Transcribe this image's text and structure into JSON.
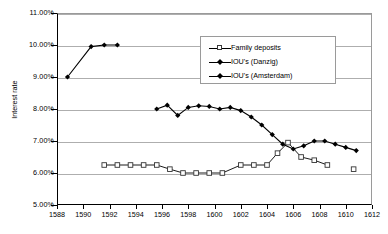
{
  "chart_data": {
    "type": "line",
    "title": "",
    "xlabel": "",
    "ylabel": "Interest rate",
    "xlim": [
      1588,
      1612
    ],
    "ylim": [
      5.0,
      11.0
    ],
    "grid": true,
    "legend_position": "upper-right-inside",
    "y_ticks": [
      "5.00%",
      "6.00%",
      "7.00%",
      "8.00%",
      "9.00%",
      "10.00%",
      "11.00%"
    ],
    "y_tick_values": [
      5.0,
      6.0,
      7.0,
      8.0,
      9.0,
      10.0,
      11.0
    ],
    "x_ticks": [
      "1588",
      "1590",
      "1592",
      "1594",
      "1596",
      "1598",
      "1600",
      "1602",
      "1604",
      "1606",
      "1608",
      "1610",
      "1612"
    ],
    "x_tick_values": [
      1588,
      1590,
      1592,
      1594,
      1596,
      1598,
      1600,
      1602,
      1604,
      1606,
      1608,
      1610,
      1612
    ],
    "series": [
      {
        "name": "Family deposits",
        "marker": "open-square",
        "color": "#000000",
        "x": [
          1591.6,
          1592.6,
          1593.6,
          1594.6,
          1595.6,
          1596.6,
          1597.6,
          1598.6,
          1599.6,
          1600.6,
          1602.0,
          1603.0,
          1604.0,
          1604.8,
          1605.6,
          1606.6,
          1607.6,
          1608.6,
          1610.6
        ],
        "y": [
          6.25,
          6.25,
          6.25,
          6.25,
          6.25,
          6.12,
          6.0,
          6.0,
          6.0,
          6.0,
          6.25,
          6.25,
          6.25,
          6.62,
          6.95,
          6.5,
          6.4,
          6.25,
          6.12
        ]
      },
      {
        "name": "IOU's (Danzig)",
        "marker": "filled-diamond",
        "color": "#000000",
        "x": [
          1588.8,
          1590.6,
          1591.6,
          1592.6
        ],
        "y": [
          9.0,
          9.95,
          10.0,
          10.0
        ]
      },
      {
        "name": "IOU's (Amsterdam)",
        "marker": "filled-diamond",
        "color": "#000000",
        "x": [
          1595.6,
          1596.4,
          1597.2,
          1598.0,
          1598.8,
          1599.6,
          1600.4,
          1601.2,
          1602.0,
          1602.8,
          1603.6,
          1604.4,
          1605.2,
          1606.0,
          1606.8,
          1607.6,
          1608.4,
          1609.2,
          1610.0,
          1610.8
        ],
        "y": [
          8.0,
          8.12,
          7.8,
          8.05,
          8.1,
          8.08,
          8.0,
          8.05,
          7.95,
          7.75,
          7.5,
          7.2,
          6.9,
          6.75,
          6.85,
          7.0,
          7.0,
          6.9,
          6.8,
          6.7
        ]
      }
    ]
  },
  "legend": {
    "items": [
      {
        "label": "Family deposits",
        "marker": "open-square"
      },
      {
        "label": "IOU's (Danzig)",
        "marker": "filled-diamond"
      },
      {
        "label": "IOU's (Amsterdam)",
        "marker": "filled-diamond"
      }
    ]
  }
}
